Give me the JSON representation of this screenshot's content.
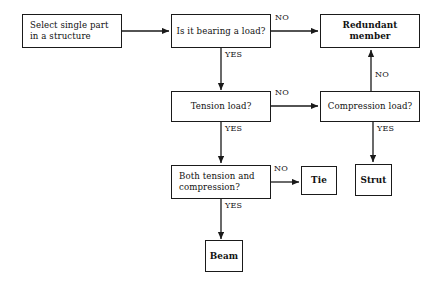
{
  "diagram": {
    "background_color": "#ffffff",
    "line_color": "#1a1a1a",
    "text_color": "#111111"
  },
  "nodes": {
    "select_part": {
      "label": "Select single part\nin a structure"
    },
    "bearing_load": {
      "label": "Is it bearing a load?"
    },
    "redundant_member": {
      "label": "Redundant member"
    },
    "tension_load": {
      "label": "Tension load?"
    },
    "compression_load": {
      "label": "Compression load?"
    },
    "both_tension_compression": {
      "label": "Both tension and\ncompression?"
    },
    "tie": {
      "label": "Tie"
    },
    "strut": {
      "label": "Strut"
    },
    "beam": {
      "label": "Beam"
    }
  },
  "edge_labels": {
    "bearing_no": "NO",
    "bearing_yes": "YES",
    "tension_no": "NO",
    "tension_yes": "YES",
    "compression_no": "NO",
    "compression_yes": "YES",
    "both_no": "NO",
    "both_yes": "YES"
  }
}
